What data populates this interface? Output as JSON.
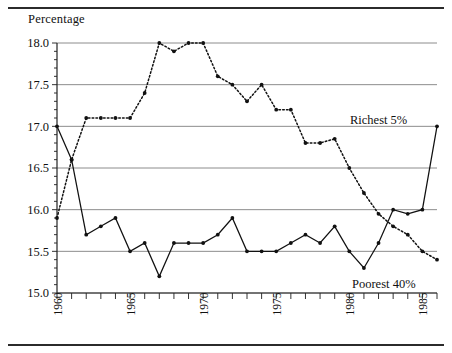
{
  "figure": {
    "y_axis_title": "Percentage"
  },
  "chart_data": {
    "type": "line",
    "title": "Percentage",
    "xlabel": "",
    "ylabel": "Percentage",
    "ylim": [
      15.0,
      18.0
    ],
    "xlim": [
      1960,
      1986
    ],
    "ytick_labels": [
      "15.0",
      "15.5",
      "16.0",
      "16.5",
      "17.0",
      "17.5",
      "18.0"
    ],
    "ytick_values": [
      15.0,
      15.5,
      16.0,
      16.5,
      17.0,
      17.5,
      18.0
    ],
    "xtick_values": [
      1960,
      1961,
      1962,
      1963,
      1964,
      1965,
      1966,
      1967,
      1968,
      1969,
      1970,
      1971,
      1972,
      1973,
      1974,
      1975,
      1976,
      1977,
      1978,
      1979,
      1980,
      1981,
      1982,
      1983,
      1984,
      1985,
      1986
    ],
    "xtick_labels": [
      {
        "value": 1960,
        "label": "1960"
      },
      {
        "value": 1965,
        "label": "1965"
      },
      {
        "value": 1970,
        "label": "1970"
      },
      {
        "value": 1975,
        "label": "1975"
      },
      {
        "value": 1980,
        "label": "1980"
      },
      {
        "value": 1985,
        "label": "1985"
      }
    ],
    "grid": "horizontal",
    "legend": "inline-annotations",
    "x": [
      1960,
      1961,
      1962,
      1963,
      1964,
      1965,
      1966,
      1967,
      1968,
      1969,
      1970,
      1971,
      1972,
      1973,
      1974,
      1975,
      1976,
      1977,
      1978,
      1979,
      1980,
      1981,
      1982,
      1983,
      1984,
      1985,
      1986
    ],
    "series": [
      {
        "name": "Richest 5%",
        "style": "solid",
        "label_text": "Richest 5%",
        "values": [
          17.0,
          16.6,
          15.7,
          15.8,
          15.9,
          15.5,
          15.6,
          15.2,
          15.6,
          15.6,
          15.6,
          15.7,
          15.9,
          15.5,
          15.5,
          15.5,
          15.6,
          15.7,
          15.6,
          15.8,
          15.5,
          15.3,
          15.6,
          16.0,
          15.95,
          16.0,
          17.0
        ]
      },
      {
        "name": "Poorest 40%",
        "style": "dotted",
        "label_text": "Poorest 40%",
        "values": [
          15.9,
          16.6,
          17.1,
          17.1,
          17.1,
          17.1,
          17.4,
          18.0,
          17.9,
          18.0,
          18.0,
          17.6,
          17.5,
          17.3,
          17.5,
          17.2,
          17.2,
          16.8,
          16.8,
          16.85,
          16.5,
          16.2,
          15.95,
          15.8,
          15.7,
          15.5,
          15.4
        ]
      }
    ]
  }
}
